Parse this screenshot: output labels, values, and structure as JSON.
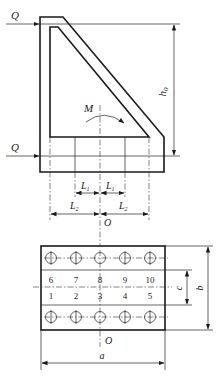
{
  "diagram": {
    "type": "bolted bracket connection — elevation and plan",
    "labels": {
      "force_top": "Q",
      "force_bottom": "Q",
      "moment": "M",
      "height": "h",
      "height_sub": "0",
      "l1_left": "L",
      "l1_right": "L",
      "l1_sub": "1",
      "l2_left": "L",
      "l2_right": "L",
      "l2_sub": "2",
      "origin_top": "O",
      "origin_bottom": "O",
      "dim_c": "c",
      "dim_b": "b",
      "dim_a": "a"
    },
    "bolt_numbers_top_row": [
      "6",
      "7",
      "8",
      "9",
      "10"
    ],
    "bolt_numbers_bottom_row": [
      "1",
      "2",
      "3",
      "4",
      "5"
    ],
    "colors": {
      "line": "#1a1a1a",
      "background": "#ffffff"
    }
  }
}
